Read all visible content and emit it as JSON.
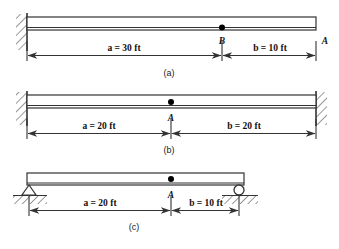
{
  "figure": {
    "line_color": "#333333",
    "hatch_color": "#555555",
    "marker_color": "#000000"
  },
  "panels": [
    {
      "caption": "(a)",
      "supports": {
        "left": "fixed-wall-support",
        "right": "free-end"
      },
      "points": [
        {
          "label": "B",
          "name": "point-b"
        },
        {
          "label": "A",
          "name": "point-a"
        }
      ],
      "dimensions": [
        {
          "label": "a = 30 ft",
          "name": "dimension-a",
          "value": 30,
          "unit": "ft",
          "symbol": "a"
        },
        {
          "label": "b = 10 ft",
          "name": "dimension-b",
          "value": 10,
          "unit": "ft",
          "symbol": "b"
        }
      ]
    },
    {
      "caption": "(b)",
      "supports": {
        "left": "fixed-wall-support",
        "right": "fixed-wall-support"
      },
      "points": [
        {
          "label": "A",
          "name": "point-a"
        }
      ],
      "dimensions": [
        {
          "label": "a = 20 ft",
          "name": "dimension-a",
          "value": 20,
          "unit": "ft",
          "symbol": "a"
        },
        {
          "label": "b = 20 ft",
          "name": "dimension-b",
          "value": 20,
          "unit": "ft",
          "symbol": "b"
        }
      ]
    },
    {
      "caption": "(c)",
      "supports": {
        "left": "pin-support",
        "right": "roller-support"
      },
      "points": [
        {
          "label": "A",
          "name": "point-a"
        }
      ],
      "dimensions": [
        {
          "label": "a = 20 ft",
          "name": "dimension-a",
          "value": 20,
          "unit": "ft",
          "symbol": "a"
        },
        {
          "label": "b = 10 ft",
          "name": "dimension-b",
          "value": 10,
          "unit": "ft",
          "symbol": "b"
        }
      ]
    }
  ]
}
